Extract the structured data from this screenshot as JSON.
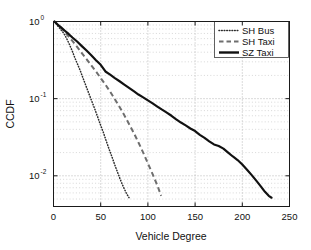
{
  "chart_data": {
    "type": "line",
    "title": "",
    "xlabel": "Vehicle Degree",
    "ylabel": "CCDF",
    "yscale": "log",
    "xlim": [
      0,
      250
    ],
    "ylim": [
      0.004,
      1.0
    ],
    "grid": true,
    "legend_position": "top-right",
    "xticks": [
      0,
      50,
      100,
      150,
      200,
      250
    ],
    "xticklabels": [
      "0",
      "50",
      "100",
      "150",
      "200",
      "250"
    ],
    "yticks": [
      1,
      0.1,
      0.01
    ],
    "yticklabels": [
      "10",
      "10",
      "10"
    ],
    "yticklabel_exponents": [
      "0",
      "-1",
      "-2"
    ],
    "series": [
      {
        "name": "SH Bus",
        "style": "dotted",
        "color": "#2b2b2b",
        "points": [
          [
            1,
            1.0
          ],
          [
            3,
            0.93
          ],
          [
            5,
            0.86
          ],
          [
            8,
            0.78
          ],
          [
            11,
            0.7
          ],
          [
            14,
            0.6
          ],
          [
            17,
            0.5
          ],
          [
            20,
            0.41
          ],
          [
            23,
            0.33
          ],
          [
            26,
            0.27
          ],
          [
            29,
            0.22
          ],
          [
            32,
            0.175
          ],
          [
            35,
            0.14
          ],
          [
            38,
            0.112
          ],
          [
            41,
            0.09
          ],
          [
            44,
            0.072
          ],
          [
            47,
            0.057
          ],
          [
            50,
            0.045
          ],
          [
            53,
            0.036
          ],
          [
            56,
            0.028
          ],
          [
            59,
            0.022
          ],
          [
            62,
            0.0175
          ],
          [
            65,
            0.0138
          ],
          [
            68,
            0.011
          ],
          [
            71,
            0.0088
          ],
          [
            74,
            0.0072
          ],
          [
            77,
            0.006
          ],
          [
            80,
            0.0052
          ]
        ]
      },
      {
        "name": "SH Taxi",
        "style": "dashed",
        "color": "#6e6e6e",
        "points": [
          [
            1,
            1.0
          ],
          [
            5,
            0.9
          ],
          [
            10,
            0.78
          ],
          [
            15,
            0.66
          ],
          [
            20,
            0.56
          ],
          [
            25,
            0.47
          ],
          [
            30,
            0.39
          ],
          [
            35,
            0.325
          ],
          [
            40,
            0.27
          ],
          [
            45,
            0.225
          ],
          [
            50,
            0.185
          ],
          [
            55,
            0.152
          ],
          [
            60,
            0.123
          ],
          [
            65,
            0.098
          ],
          [
            70,
            0.078
          ],
          [
            75,
            0.061
          ],
          [
            80,
            0.047
          ],
          [
            85,
            0.036
          ],
          [
            90,
            0.027
          ],
          [
            95,
            0.02
          ],
          [
            100,
            0.0145
          ],
          [
            105,
            0.0105
          ],
          [
            110,
            0.0075
          ],
          [
            114,
            0.0055
          ]
        ]
      },
      {
        "name": "SZ Taxi",
        "style": "solid",
        "color": "#111111",
        "points": [
          [
            1,
            1.0
          ],
          [
            4,
            0.92
          ],
          [
            8,
            0.84
          ],
          [
            12,
            0.76
          ],
          [
            16,
            0.69
          ],
          [
            20,
            0.62
          ],
          [
            25,
            0.55
          ],
          [
            30,
            0.48
          ],
          [
            35,
            0.42
          ],
          [
            40,
            0.365
          ],
          [
            45,
            0.315
          ],
          [
            50,
            0.275
          ],
          [
            55,
            0.225
          ],
          [
            60,
            0.205
          ],
          [
            65,
            0.185
          ],
          [
            70,
            0.168
          ],
          [
            75,
            0.152
          ],
          [
            80,
            0.138
          ],
          [
            85,
            0.125
          ],
          [
            90,
            0.113
          ],
          [
            95,
            0.104
          ],
          [
            100,
            0.095
          ],
          [
            105,
            0.087
          ],
          [
            110,
            0.079
          ],
          [
            115,
            0.072
          ],
          [
            120,
            0.066
          ],
          [
            125,
            0.06
          ],
          [
            130,
            0.054
          ],
          [
            135,
            0.049
          ],
          [
            140,
            0.045
          ],
          [
            145,
            0.041
          ],
          [
            150,
            0.038
          ],
          [
            155,
            0.034
          ],
          [
            160,
            0.031
          ],
          [
            165,
            0.028
          ],
          [
            170,
            0.0255
          ],
          [
            175,
            0.0243
          ],
          [
            180,
            0.0225
          ],
          [
            185,
            0.02
          ],
          [
            190,
            0.0178
          ],
          [
            195,
            0.016
          ],
          [
            200,
            0.014
          ],
          [
            205,
            0.012
          ],
          [
            210,
            0.0102
          ],
          [
            215,
            0.0086
          ],
          [
            220,
            0.0072
          ],
          [
            224,
            0.0062
          ],
          [
            228,
            0.0055
          ],
          [
            231,
            0.0052
          ]
        ]
      }
    ]
  },
  "legend": {
    "items": [
      {
        "label": "SH Bus"
      },
      {
        "label": "SH Taxi"
      },
      {
        "label": "SZ Taxi"
      }
    ]
  }
}
